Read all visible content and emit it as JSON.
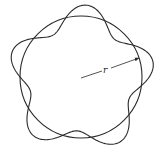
{
  "diagram": {
    "radius_label": "r",
    "lobes": 5,
    "stroke_color": "#2a2a2a"
  }
}
